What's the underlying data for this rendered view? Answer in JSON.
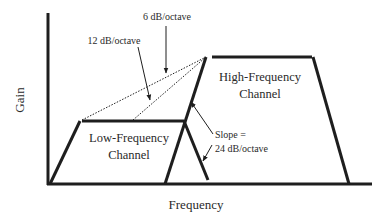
{
  "diagram": {
    "axes": {
      "x_label": "Frequency",
      "y_label": "Gain"
    },
    "channels": [
      {
        "name_line1": "Low-Frequency",
        "name_line2": "Channel"
      },
      {
        "name_line1": "High-Frequency",
        "name_line2": "Channel"
      }
    ],
    "annotations": {
      "slope_6": "6 dB/octave",
      "slope_12": "12 dB/octave",
      "slope_24_line1": "Slope =",
      "slope_24_line2": "24 dB/octave"
    },
    "colors": {
      "line": "#1e1e1e",
      "text": "#2a2a2a",
      "background": "#ffffff"
    }
  }
}
